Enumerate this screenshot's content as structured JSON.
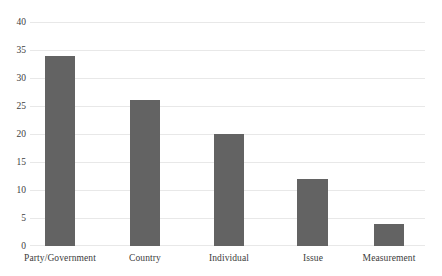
{
  "chart_data": {
    "type": "bar",
    "title": "",
    "subtitle": "",
    "xlabel": "",
    "ylabel": "",
    "categories": [
      "Party/Government",
      "Country",
      "Individual",
      "Issue",
      "Measurement"
    ],
    "values": [
      34,
      26,
      20,
      12,
      4
    ],
    "series": [
      {
        "name": "",
        "values": [
          34,
          26,
          20,
          12,
          4
        ]
      }
    ],
    "ylim": [
      0,
      40
    ],
    "ytick_labels": [
      "0",
      "5",
      "10",
      "15",
      "20",
      "25",
      "30",
      "35",
      "40"
    ],
    "ytick_values": [
      0,
      5,
      10,
      15,
      20,
      25,
      30,
      35,
      40
    ],
    "grid": true,
    "grid_axis": "y",
    "legend": false,
    "legend_position": "none",
    "bar_color": "#636363",
    "gridline_color": "#e8e8e8",
    "background_color": "#ffffff",
    "text_color": "#3b3b3b",
    "annotations": []
  }
}
